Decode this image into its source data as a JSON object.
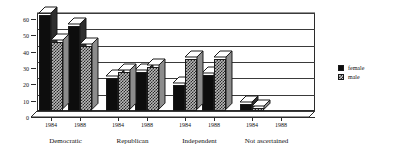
{
  "chart_data": {
    "type": "bar",
    "title": "",
    "subtitle": "",
    "xlabel": "",
    "ylabel": "",
    "ylim": [
      0,
      60
    ],
    "yticks": [
      0,
      10,
      20,
      30,
      40,
      50,
      60
    ],
    "grid": true,
    "legend_position": "right",
    "style": "3d-clustered-column",
    "groups": [
      {
        "name": "Democratic",
        "years": [
          "1984",
          "1988"
        ]
      },
      {
        "name": "Republican",
        "years": [
          "1984",
          "1988"
        ]
      },
      {
        "name": "Independent",
        "years": [
          "1984",
          "1988"
        ]
      },
      {
        "name": "Not ascertained",
        "years": [
          "1984",
          "1988"
        ]
      }
    ],
    "categories": [
      "Democratic 1984",
      "Democratic 1988",
      "Republican 1984",
      "Republican 1988",
      "Independent 1984",
      "Independent 1988",
      "Not ascertained 1984",
      "Not ascertained 1988"
    ],
    "series": [
      {
        "name": "female",
        "color": "#0d0d0d",
        "values": [
          59,
          52,
          20,
          24,
          16,
          22,
          4,
          0
        ]
      },
      {
        "name": "male",
        "color": "#b9b9b9",
        "values": [
          42,
          40,
          24,
          27,
          32,
          32,
          2,
          0
        ]
      }
    ]
  },
  "legend": {
    "items": [
      {
        "label": "female",
        "swatch": "solid-black-square"
      },
      {
        "label": "male",
        "swatch": "checkered-square"
      }
    ]
  },
  "axes": {
    "y": {
      "ticks": [
        "60",
        "50",
        "40",
        "30",
        "20",
        "10",
        "0"
      ]
    },
    "x": {
      "year_labels": [
        "1984",
        "1988",
        "1984",
        "1988",
        "1984",
        "1988",
        "1984",
        "1988"
      ],
      "group_labels": [
        "Democratic",
        "Republican",
        "Independent",
        "Not ascertained"
      ]
    }
  }
}
